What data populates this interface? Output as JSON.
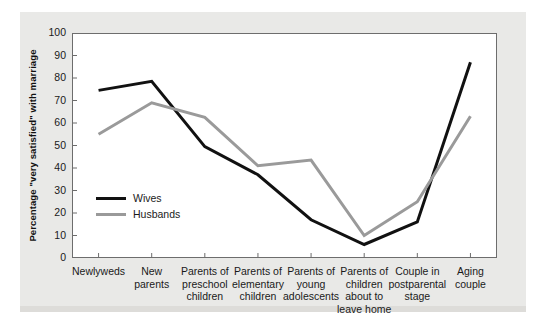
{
  "chart_data": {
    "type": "line",
    "title": "",
    "xlabel": "",
    "ylabel": "Percentage \"very satisfied\" with marriage",
    "ylim": [
      0,
      100
    ],
    "yticks": [
      "0",
      "10",
      "20",
      "30",
      "40",
      "50",
      "60",
      "70",
      "80",
      "90",
      "100"
    ],
    "grid": false,
    "legend_position": "inside-lower-left",
    "categories": [
      "Newlyweds",
      "New parents",
      "Parents of preschool children",
      "Parents of elementary children",
      "Parents of young adolescents",
      "Parents of children about to leave home",
      "Couple in postparental stage",
      "Aging couple"
    ],
    "category_lines": [
      [
        "Newlyweds"
      ],
      [
        "New",
        "parents"
      ],
      [
        "Parents of",
        "preschool",
        "children"
      ],
      [
        "Parents of",
        "elementary",
        "children"
      ],
      [
        "Parents of",
        "young",
        "adolescents"
      ],
      [
        "Parents of",
        "children",
        "about to",
        "leave home"
      ],
      [
        "Couple in",
        "postparental",
        "stage"
      ],
      [
        "Aging",
        "couple"
      ]
    ],
    "series": [
      {
        "name": "Wives",
        "color": "#111111",
        "values": [
          74.5,
          78.5,
          49.5,
          37,
          17,
          6,
          16,
          87
        ]
      },
      {
        "name": "Husbands",
        "color": "#9a9a9a",
        "values": [
          55,
          69,
          62.5,
          41,
          43.5,
          10,
          25,
          63
        ]
      }
    ]
  },
  "legend": {
    "items": [
      {
        "label": "Wives",
        "color": "#111111"
      },
      {
        "label": "Husbands",
        "color": "#9a9a9a"
      }
    ]
  },
  "colors": {
    "panel_background": "#e9e9e7",
    "plot_background": "#ffffff",
    "axis": "#6d6d6d",
    "text": "#1a1a1a",
    "wives": "#111111",
    "husbands": "#9a9a9a"
  }
}
